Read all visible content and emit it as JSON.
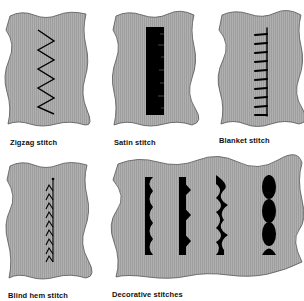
{
  "figure": {
    "colors": {
      "fabric": "#a9a9a9",
      "fabric_edge": "#555555",
      "thread": "#000000",
      "background": "#ffffff"
    },
    "swatches": [
      {
        "id": "zigzag",
        "label": "Zigzag stitch"
      },
      {
        "id": "satin",
        "label": "Satin stitch"
      },
      {
        "id": "blanket",
        "label": "Blanket stitch"
      },
      {
        "id": "blind-hem",
        "label": "Blind hem stitch"
      },
      {
        "id": "decorative",
        "label": "Decorative stitches"
      }
    ]
  }
}
